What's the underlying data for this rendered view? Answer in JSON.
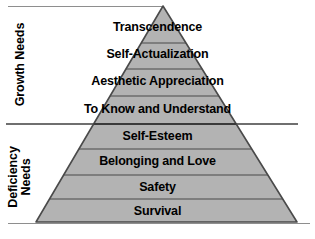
{
  "diagram": {
    "type": "pyramid",
    "fill_color": "#b3b3b3",
    "outline_color": "#4a4a4a",
    "rule_color": "#8e8e8e",
    "text_color": "#000000",
    "background_color": "#ffffff"
  },
  "categories": [
    {
      "id": "growth",
      "label": "Growth Needs",
      "orientation": "vertical",
      "levels": [
        "Transcendence",
        "Self-Actualization",
        "Aesthetic Appreciation",
        "To Know and Understand"
      ]
    },
    {
      "id": "deficiency",
      "label": "Deficiency\nNeeds",
      "orientation": "vertical",
      "levels": [
        "Self-Esteem",
        "Belonging and Love",
        "Safety",
        "Survival"
      ]
    }
  ],
  "levels": [
    {
      "rank": 1,
      "label": "Transcendence",
      "group": "Growth Needs",
      "label_center_y": 27
    },
    {
      "rank": 2,
      "label": "Self-Actualization",
      "group": "Growth Needs",
      "label_center_y": 54
    },
    {
      "rank": 3,
      "label": "Aesthetic Appreciation",
      "group": "Growth Needs",
      "label_center_y": 81
    },
    {
      "rank": 4,
      "label": "To Know and Understand",
      "group": "Growth Needs",
      "label_center_y": 109
    },
    {
      "rank": 5,
      "label": "Self-Esteem",
      "group": "Deficiency Needs",
      "label_center_y": 136
    },
    {
      "rank": 6,
      "label": "Belonging and Love",
      "group": "Deficiency Needs",
      "label_center_y": 161
    },
    {
      "rank": 7,
      "label": "Safety",
      "group": "Deficiency Needs",
      "label_center_y": 187
    },
    {
      "rank": 8,
      "label": "Survival",
      "group": "Deficiency Needs",
      "label_center_y": 211
    }
  ],
  "geometry": {
    "apex_x": 163,
    "apex_y": 6,
    "base_left_x": 36,
    "base_right_x": 297,
    "base_y": 222,
    "divider_y": [
      43,
      69,
      96,
      124,
      149,
      175,
      199
    ],
    "rules": {
      "top": {
        "x1": 8,
        "x2": 164,
        "y": 6
      },
      "middle": {
        "x1": 6,
        "x2": 298,
        "y": 124
      },
      "bottom": {
        "x1": 8,
        "x2": 310,
        "y": 224
      }
    }
  }
}
